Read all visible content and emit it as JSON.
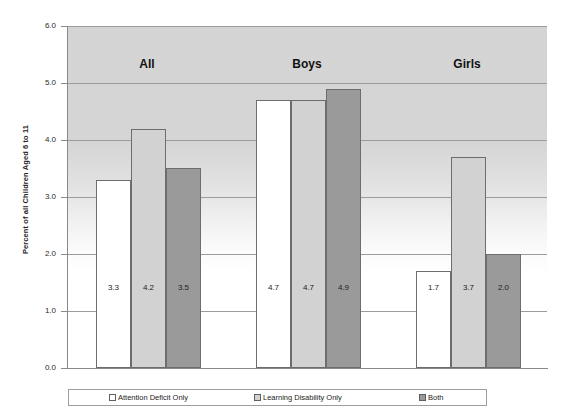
{
  "chart_data": {
    "type": "bar",
    "title": "",
    "xlabel": "",
    "ylabel": "Percent of all Children Aged 6 to 11",
    "categories": [
      "All",
      "Boys",
      "Girls"
    ],
    "series": [
      {
        "name": "Attention Deficit Only",
        "values": [
          3.3,
          4.7,
          1.7
        ],
        "color": "#ffffff"
      },
      {
        "name": "Learning Disability Only",
        "values": [
          4.2,
          4.7,
          3.7
        ],
        "color": "#d2d2d2"
      },
      {
        "name": "Both",
        "values": [
          3.5,
          4.9,
          2.0
        ],
        "color": "#9a9a9a"
      }
    ],
    "value_labels": [
      [
        "3.3",
        "4.7",
        "1.7"
      ],
      [
        "4.2",
        "4.7",
        "3.7"
      ],
      [
        "3.5",
        "4.9",
        "2.0"
      ]
    ],
    "ylim": [
      0.0,
      6.0
    ],
    "yticks": [
      0.0,
      1.0,
      2.0,
      3.0,
      4.0,
      5.0,
      6.0
    ],
    "ytick_labels": [
      "0.0",
      "1.0",
      "2.0",
      "3.0",
      "4.0",
      "5.0",
      "6.0"
    ],
    "grid": true,
    "legend_position": "bottom"
  },
  "axis": {
    "y_title": "Percent of all Children Aged 6 to 11"
  },
  "legend": {
    "items": [
      {
        "label": "Attention Deficit Only"
      },
      {
        "label": "Learning Disability Only"
      },
      {
        "label": "Both"
      }
    ]
  }
}
